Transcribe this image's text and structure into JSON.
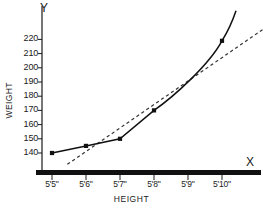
{
  "axes": {
    "y_letter": "Y",
    "x_letter": "X",
    "y_title": "WEIGHT",
    "x_title": "HEIGHT"
  },
  "chart_data": {
    "type": "line",
    "title": "",
    "xlabel": "HEIGHT",
    "ylabel": "WEIGHT",
    "categories": [
      "5'5\"",
      "5'6\"",
      "5'7\"",
      "5'8\"",
      "5'9\"",
      "5'10\""
    ],
    "x": [
      65,
      66,
      67,
      68,
      69,
      70
    ],
    "ylim": [
      130,
      228
    ],
    "xlim": [
      64.4,
      71.2
    ],
    "yticks": [
      140,
      150,
      160,
      170,
      180,
      190,
      200,
      210,
      220
    ],
    "ytick_labels": [
      "140",
      "150",
      "160",
      "170",
      "180",
      "190",
      "200",
      "210",
      "220"
    ],
    "grid": false,
    "legend": "none",
    "series": [
      {
        "name": "observed-curve",
        "style": "solid",
        "marker": "square",
        "color": "#111111",
        "points": [
          {
            "x": 65,
            "y": 140
          },
          {
            "x": 66,
            "y": 145
          },
          {
            "x": 67,
            "y": 150
          },
          {
            "x": 68,
            "y": 170
          },
          {
            "x": 70,
            "y": 219
          }
        ],
        "extends_beyond_last_point": true
      },
      {
        "name": "trend-line",
        "style": "dashed",
        "marker": "none",
        "color": "#333333",
        "points": [
          {
            "x": 65.45,
            "y": 132
          },
          {
            "x": 71.2,
            "y": 227
          }
        ]
      }
    ]
  }
}
